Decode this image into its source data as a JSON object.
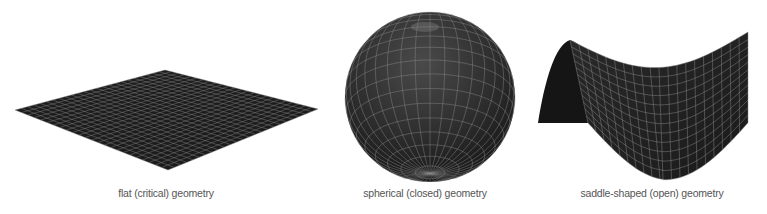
{
  "panels": [
    {
      "id": "flat",
      "caption": "flat (critical) geometry",
      "caption_x": 166
    },
    {
      "id": "spherical",
      "caption": "spherical (closed) geometry",
      "caption_x": 425
    },
    {
      "id": "saddle",
      "caption": "saddle-shaped (open) geometry",
      "caption_x": 652
    }
  ],
  "colors": {
    "surface": "#1c1c1c",
    "grid": "#8a8a8a",
    "caption": "#555555",
    "background": "#ffffff"
  }
}
